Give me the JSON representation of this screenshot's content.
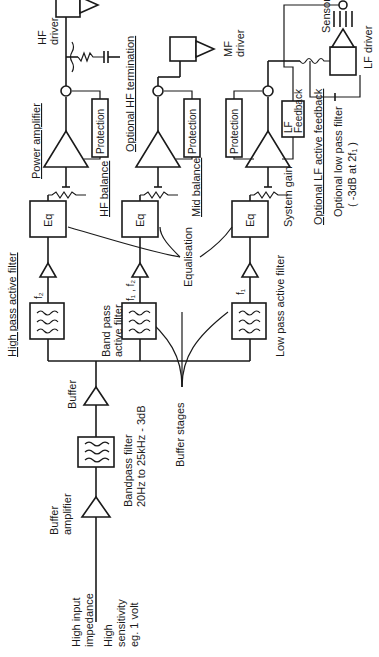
{
  "diagram": {
    "orientation": "rotated 90 degrees counter-clockwise",
    "input": {
      "impedance_label": [
        "High input",
        "impedance"
      ],
      "sensitivity_label": [
        "High",
        "sensitivity",
        "eg. 1 volt"
      ]
    },
    "front_end": {
      "buffer_amplifier": [
        "Buffer",
        "amplifier"
      ],
      "bandpass_filter": [
        "Bandpass filter",
        "20Hz to 25kHz - 3dB"
      ],
      "buffer": "Buffer",
      "buffer_stages": "Buffer stages"
    },
    "channels": [
      {
        "id": "hf",
        "filter_label": "High pass active filter",
        "freq_label": "f₂",
        "eq_label": "Eq",
        "balance_label": "HF balance",
        "amp_label": "Power amplifier",
        "protection_label": "Protection",
        "termination_label": "Optional HF termination",
        "driver_label": [
          "HF",
          "driver"
        ]
      },
      {
        "id": "mf",
        "filter_label": [
          "Band pass",
          "active filter"
        ],
        "freq_label": "f₁ , f₂",
        "eq_label": "Eq",
        "balance_label": "Mid balance",
        "protection_label": "Protection",
        "driver_label": [
          "MF",
          "driver"
        ]
      },
      {
        "id": "lf",
        "filter_label": "Low pass active filter",
        "freq_label": "f₁",
        "eq_label": "Eq",
        "balance_label": "System gain",
        "protection_label": "Protection",
        "feedback_label": [
          "LF",
          "Feedback"
        ],
        "feedback_note": "Optional LF active feedback",
        "lowpass_note": [
          "Optional low pass filter",
          "( -3dB at 2f₁ )"
        ],
        "sensor_label": "Sensor",
        "driver_label": "LF driver"
      }
    ],
    "equalisation_label": "Equalisation"
  }
}
